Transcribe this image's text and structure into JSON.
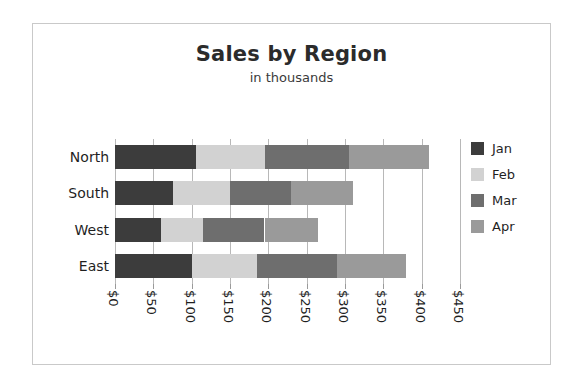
{
  "chart_data": {
    "type": "bar",
    "orientation": "horizontal",
    "stacked": true,
    "title": "Sales by Region",
    "subtitle": "in thousands",
    "xlabel": "",
    "ylabel": "",
    "categories": [
      "North",
      "South",
      "West",
      "East"
    ],
    "series": [
      {
        "name": "Jan",
        "color": "#3c3c3c",
        "values": [
          105,
          75,
          60,
          100
        ]
      },
      {
        "name": "Feb",
        "color": "#d2d2d2",
        "values": [
          90,
          75,
          55,
          85
        ]
      },
      {
        "name": "Mar",
        "color": "#6e6e6e",
        "values": [
          110,
          80,
          80,
          105
        ]
      },
      {
        "name": "Apr",
        "color": "#9a9a9a",
        "values": [
          105,
          80,
          70,
          90
        ]
      }
    ],
    "totals": [
      410,
      310,
      265,
      380
    ],
    "xlim": [
      0,
      450
    ],
    "xticks": [
      0,
      50,
      100,
      150,
      200,
      250,
      300,
      350,
      400,
      450
    ],
    "xtick_labels": [
      "$0",
      "$50",
      "$100",
      "$150",
      "$200",
      "$250",
      "$300",
      "$350",
      "$400",
      "$450"
    ],
    "grid": true,
    "legend_position": "right",
    "frame_color": "#c9c9c9",
    "gridline_color": "#b8b8b8",
    "text_color": "#1f1f1f",
    "background": "#ffffff"
  }
}
